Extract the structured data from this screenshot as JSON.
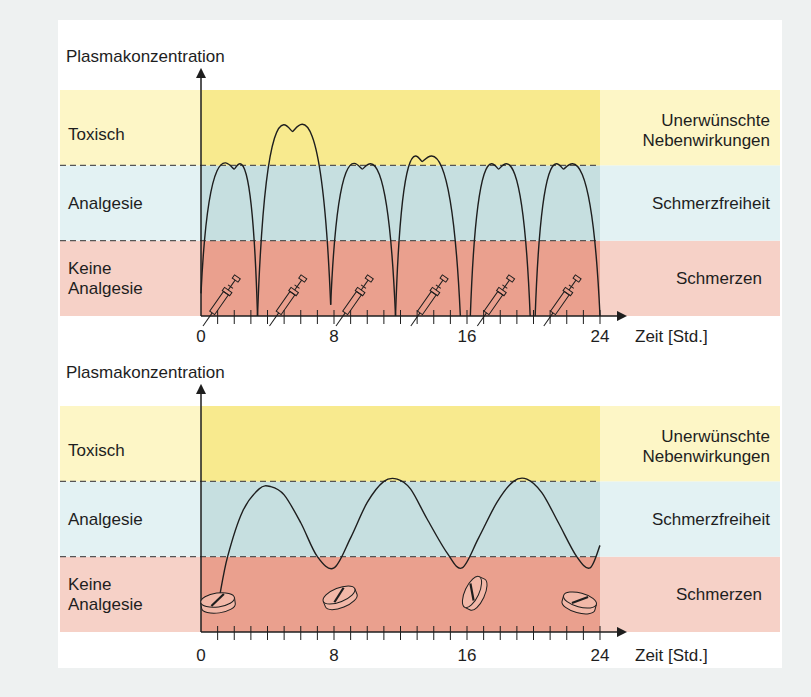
{
  "colors": {
    "toxic_light": "#fdf6c6",
    "toxic_plot": "#f8ea8e",
    "analgesia_light": "#e3f2f3",
    "analgesia_plot": "#c6dfe0",
    "pain_light": "#f6d1c7",
    "pain_plot": "#eaa08e",
    "line": "#1e1e1e",
    "background": "#eef1f1"
  },
  "chart_data": [
    {
      "type": "line",
      "name": "injection",
      "title": "",
      "ylabel": "Plasmakonzentration",
      "xlabel": "Zeit [Std.]",
      "xlim": [
        0,
        24
      ],
      "ylim": [
        0,
        3
      ],
      "x_ticks": [
        0,
        8,
        16,
        24
      ],
      "x_minor_tick_step": 1,
      "zones_left": [
        "Keine Analgesie",
        "Analgesie",
        "Toxisch"
      ],
      "zones_right": [
        "Schmerzen",
        "Schmerzfreiheit",
        "Unerwünschte Nebenwirkungen"
      ],
      "zone_bounds": [
        0,
        1,
        2,
        3
      ],
      "dose_icon": "syringe",
      "dose_times": [
        0,
        4,
        8,
        12.5,
        16.5,
        20.5
      ],
      "doses": [
        {
          "start": 0,
          "peak_t": 2,
          "peak": 1.95,
          "end": 3.4
        },
        {
          "start": 3.4,
          "peak_t": 5.5,
          "peak": 2.45,
          "end": 7.8
        },
        {
          "start": 7.8,
          "peak_t": 9.7,
          "peak": 1.95,
          "end": 11.7
        },
        {
          "start": 11.7,
          "peak_t": 13.3,
          "peak": 2.05,
          "end": 15.6
        },
        {
          "start": 16.2,
          "peak_t": 17.9,
          "peak": 1.95,
          "end": 19.8
        },
        {
          "start": 20.1,
          "peak_t": 21.8,
          "peak": 1.95,
          "end": 24
        }
      ],
      "min_levels": [
        0.3,
        0,
        0.15,
        0,
        0,
        0
      ]
    },
    {
      "type": "line",
      "name": "oral",
      "title": "",
      "ylabel": "Plasmakonzentration",
      "xlabel": "Zeit [Std.]",
      "xlim": [
        0,
        24
      ],
      "ylim": [
        0,
        3
      ],
      "x_ticks": [
        0,
        8,
        16,
        24
      ],
      "x_minor_tick_step": 1,
      "zones_left": [
        "Keine Analgesie",
        "Analgesie",
        "Toxisch"
      ],
      "zones_right": [
        "Schmerzen",
        "Schmerzfreiheit",
        "Unerwünschte Nebenwirkungen"
      ],
      "zone_bounds": [
        0,
        1,
        2,
        3
      ],
      "dose_icon": "tablet",
      "dose_times": [
        1,
        8,
        16,
        24
      ],
      "points": [
        [
          1.1,
          0.45
        ],
        [
          1.6,
          1.0
        ],
        [
          2.5,
          1.6
        ],
        [
          3.5,
          1.9
        ],
        [
          4.2,
          1.93
        ],
        [
          5.0,
          1.82
        ],
        [
          6.0,
          1.45
        ],
        [
          7.0,
          1.0
        ],
        [
          8.0,
          0.85
        ],
        [
          9.0,
          1.25
        ],
        [
          10.0,
          1.72
        ],
        [
          11.0,
          2.0
        ],
        [
          11.8,
          2.03
        ],
        [
          12.6,
          1.9
        ],
        [
          13.6,
          1.5
        ],
        [
          14.8,
          1.05
        ],
        [
          15.7,
          0.85
        ],
        [
          16.7,
          1.25
        ],
        [
          17.8,
          1.72
        ],
        [
          18.8,
          2.0
        ],
        [
          19.6,
          2.03
        ],
        [
          20.5,
          1.85
        ],
        [
          21.5,
          1.45
        ],
        [
          22.6,
          1.0
        ],
        [
          23.4,
          0.85
        ],
        [
          24.0,
          1.15
        ]
      ]
    }
  ]
}
